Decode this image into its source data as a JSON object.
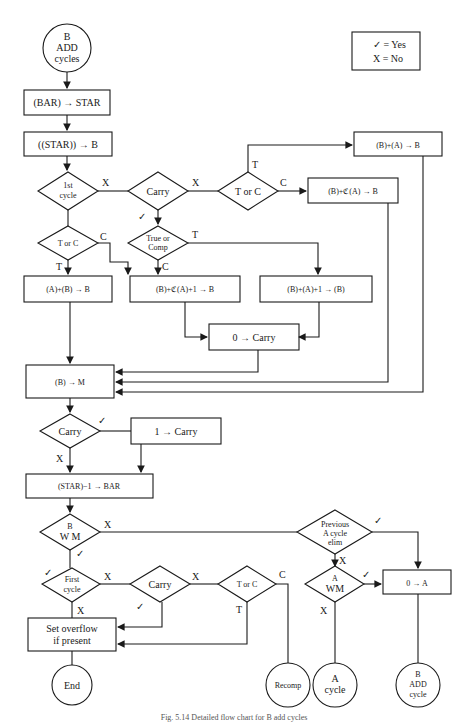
{
  "legend": {
    "yes": "✓ = Yes",
    "no": "X = No"
  },
  "nodes": {
    "start": [
      "B",
      "ADD",
      "cycles"
    ],
    "bar_to_star": "(BAR) → STAR",
    "star_to_b": "((STAR)) → B",
    "first_cycle": [
      "1st",
      "cycle"
    ],
    "carry1": "Carry",
    "t_or_c_top": "T or C",
    "b_plus_a": "(B)+(A) → B",
    "b_plus_comp_a": "(B)+ℭ(A) → B",
    "t_or_c_left": "T or C",
    "true_or_comp": [
      "True or",
      "Comp"
    ],
    "a_plus_b": "(A)+(B) → B",
    "b_plus_comp_a_1": "(B)+ℭ(A)+1 → B",
    "b_plus_a_1": "(B)+(A)+1 → (B)",
    "zero_carry": "0 → Carry",
    "b_to_m": "(B) → M",
    "carry2": "Carry",
    "one_carry": "1 → Carry",
    "star_minus_1": "(STAR)−1 → BAR",
    "b_wm": [
      "B",
      "W M"
    ],
    "prev_a_cycle": [
      "Previous",
      "A cycle",
      "elim"
    ],
    "a_wm": [
      "A",
      "WM"
    ],
    "zero_a": "0 → A",
    "first_cycle2": [
      "First",
      "cycle"
    ],
    "carry3": "Carry",
    "t_or_c_bottom": "T or C",
    "set_overflow": [
      "Set overflow",
      "if present"
    ],
    "end": "End",
    "recomp": "Recomp",
    "a_cycle": [
      "A",
      "cycle"
    ],
    "b_add_cycle": [
      "B",
      "ADD",
      "cycle"
    ]
  },
  "edge_labels": {
    "x": "X",
    "t": "T",
    "c": "C",
    "check": "✓"
  },
  "caption": "Fig. 5.14 Detailed flow chart for B add cycles"
}
